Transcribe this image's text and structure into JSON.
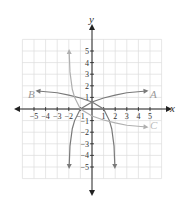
{
  "chart_data": {
    "type": "line",
    "title": "",
    "xlabel": "x",
    "ylabel": "y",
    "xlim": [
      -6,
      6
    ],
    "ylim": [
      -6,
      6
    ],
    "grid": true,
    "x_ticks": [
      -5,
      -4,
      -3,
      -2,
      -1,
      1,
      2,
      3,
      4,
      5
    ],
    "y_ticks": [
      -5,
      -4,
      -3,
      -2,
      -1,
      1,
      2,
      3,
      4,
      5
    ],
    "series": [
      {
        "name": "A",
        "color": "#7a7a7a",
        "description": "increasing logarithmic curve, vertical asymptote x=-2, through (-1,0), ending arrow near (5,1.3)",
        "points": [
          [
            -1.97,
            -5
          ],
          [
            -1.9,
            -3.2
          ],
          [
            -1.7,
            -1.7
          ],
          [
            -1.5,
            -1.0
          ],
          [
            -1,
            0
          ],
          [
            0,
            0.6
          ],
          [
            1,
            0.95
          ],
          [
            2,
            1.2
          ],
          [
            3,
            1.4
          ],
          [
            4.7,
            1.55
          ]
        ]
      },
      {
        "name": "B",
        "color": "#7a7a7a",
        "description": "decreasing logarithmic curve, vertical asymptote x=2, through (1,0), ending arrow near (-5,1.3)",
        "points": [
          [
            1.97,
            -5
          ],
          [
            1.9,
            -3.2
          ],
          [
            1.7,
            -1.7
          ],
          [
            1.5,
            -1.0
          ],
          [
            1,
            0
          ],
          [
            0,
            0.6
          ],
          [
            -1,
            0.95
          ],
          [
            -2,
            1.2
          ],
          [
            -3,
            1.4
          ],
          [
            -4.7,
            1.55
          ]
        ]
      },
      {
        "name": "C",
        "color": "#b0b0b0",
        "description": "decreasing logarithmic curve, vertical asymptote x=-2, through (-1,0), ending arrow near (5,-1.3)",
        "points": [
          [
            -1.97,
            5
          ],
          [
            -1.9,
            3.2
          ],
          [
            -1.7,
            1.7
          ],
          [
            -1.5,
            1.0
          ],
          [
            -1,
            0
          ],
          [
            0,
            -0.6
          ],
          [
            1,
            -0.95
          ],
          [
            2,
            -1.2
          ],
          [
            3,
            -1.4
          ],
          [
            4.7,
            -1.55
          ]
        ]
      }
    ],
    "legend": [
      "A",
      "B",
      "C"
    ]
  },
  "labels": {
    "x_axis": "x",
    "y_axis": "y",
    "curve_a": "A",
    "curve_b": "B",
    "curve_c": "C"
  }
}
